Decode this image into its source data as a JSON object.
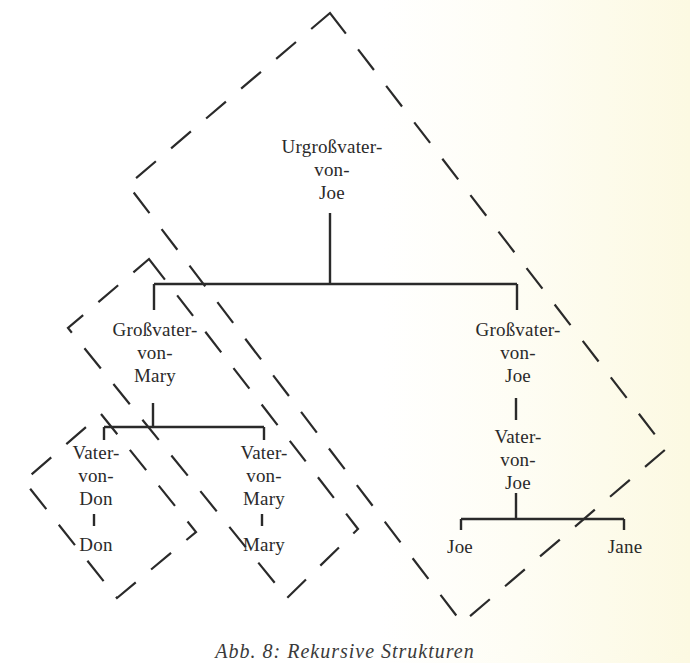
{
  "colors": {
    "line": "#2a2a2a",
    "background": "#ffffff",
    "tint": "#fcf9e2"
  },
  "nodes": {
    "root": {
      "label": "Urgroßvater-\nvon-\nJoe"
    },
    "grandfather_mary": {
      "label": "Großvater-\nvon-\nMary"
    },
    "grandfather_joe": {
      "label": "Großvater-\nvon-\nJoe"
    },
    "father_don": {
      "label": "Vater-\nvon-\nDon"
    },
    "don": {
      "label": "Don"
    },
    "father_mary": {
      "label": "Vater-\nvon-\nMary"
    },
    "mary": {
      "label": "Mary"
    },
    "father_joe": {
      "label": "Vater-\nvon-\nJoe"
    },
    "joe": {
      "label": "Joe"
    },
    "jane": {
      "label": "Jane"
    }
  },
  "edges": [
    [
      "root",
      "grandfather_mary"
    ],
    [
      "root",
      "grandfather_joe"
    ],
    [
      "grandfather_mary",
      "father_don"
    ],
    [
      "grandfather_mary",
      "father_mary"
    ],
    [
      "father_don",
      "don"
    ],
    [
      "father_mary",
      "mary"
    ],
    [
      "grandfather_joe",
      "father_joe"
    ],
    [
      "father_joe",
      "joe"
    ],
    [
      "father_joe",
      "jane"
    ]
  ],
  "groups": [
    {
      "name": "large-dashed-group",
      "contains": [
        "root",
        "grandfather_mary",
        "grandfather_joe",
        "father_mary",
        "mary",
        "father_joe",
        "joe"
      ]
    },
    {
      "name": "medium-dashed-group",
      "contains": [
        "grandfather_mary",
        "father_don",
        "father_mary",
        "mary"
      ]
    },
    {
      "name": "small-dashed-group",
      "contains": [
        "father_don",
        "don"
      ]
    }
  ],
  "caption": "Abb. 8: Rekursive Strukturen"
}
